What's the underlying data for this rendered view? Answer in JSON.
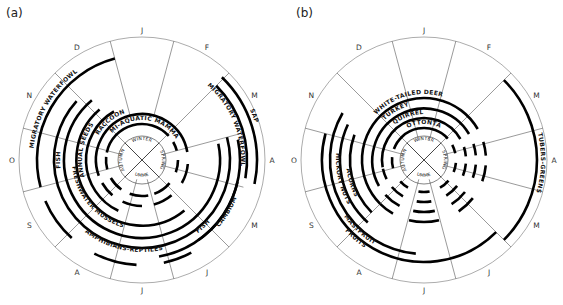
{
  "figure": {
    "panels": [
      {
        "id": "a",
        "label": "(a)",
        "center": [
          142,
          160
        ],
        "outer_radius": 123,
        "months": [
          "J",
          "F",
          "M",
          "A",
          "M",
          "J",
          "J",
          "A",
          "S",
          "O",
          "N",
          "D"
        ],
        "seasons": [
          "WINTER",
          "SPRING",
          "SUMMER",
          "AUTUMN"
        ],
        "season_radius": 20,
        "spokes": [
          {
            "angle": 15,
            "r0": 44,
            "r1": 123
          },
          {
            "angle": 45,
            "r0": 0,
            "r1": 123
          },
          {
            "angle": 75,
            "r0": 20,
            "r1": 100
          },
          {
            "angle": 105,
            "r0": 20,
            "r1": 105
          },
          {
            "angle": 135,
            "r0": 0,
            "r1": 123
          },
          {
            "angle": 165,
            "r0": 20,
            "r1": 123
          },
          {
            "angle": 195,
            "r0": 20,
            "r1": 123
          },
          {
            "angle": 225,
            "r0": 0,
            "r1": 123
          },
          {
            "angle": 255,
            "r0": 20,
            "r1": 123
          },
          {
            "angle": 285,
            "r0": 20,
            "r1": 123
          },
          {
            "angle": 315,
            "r0": 0,
            "r1": 123
          },
          {
            "angle": 345,
            "r0": 44,
            "r1": 123
          }
        ],
        "rings": [
          {
            "name": "SEMI-AQUATIC MAMMALS",
            "r": 36,
            "solid": [
              [
                282,
                48
              ]
            ],
            "dashes": [
              [
                60,
                75
              ],
              [
                90,
                110
              ],
              [
                130,
                160
              ],
              [
                170,
                200
              ],
              [
                215,
                240
              ],
              [
                255,
                275
              ]
            ],
            "label_angle": 0
          },
          {
            "name": "RACCOON",
            "r": 46,
            "solid": [
              [
                250,
                80
              ]
            ],
            "dashes": [
              [
                95,
                120
              ],
              [
                140,
                165
              ],
              [
                180,
                205
              ],
              [
                220,
                240
              ]
            ],
            "label_angle": 315
          },
          {
            "name": "ANNUAL SEEDS",
            "r": 56,
            "solid": [
              [
                205,
                330
              ]
            ],
            "dashes": [],
            "label_angle": 282
          },
          {
            "name": "FRESHWATER MUSSELS",
            "r": 66,
            "solid": [
              [
                140,
                320
              ]
            ],
            "dashes": [],
            "label_angle": 240
          },
          {
            "name": "FISH",
            "r": 78,
            "solid": [
              [
                78,
                320
              ]
            ],
            "dashes": [],
            "label_angle": 270
          },
          {
            "name": "AMPHIBIANS-REPTILES",
            "r": 88,
            "solid": [
              [
                75,
                312
              ]
            ],
            "dashes": [],
            "label_angle": 185
          },
          {
            "name": "FISH-SPRING",
            "r": 98,
            "solid": [
              [
                78,
                170
              ]
            ],
            "dashes": [],
            "label_angle": null
          },
          {
            "name": "CAMBIUM",
            "r": 98,
            "solid": [
              [
                103,
                145
              ]
            ],
            "dashes": [],
            "label_angle": 112
          },
          {
            "name": "MIGRATORY WATERFOWL",
            "r": 105,
            "solid": [
              [
                255,
                345
              ],
              [
                45,
                100
              ]
            ],
            "dashes": [
              [
                152,
                168
              ],
              [
                183,
                207
              ],
              [
                222,
                247
              ]
            ],
            "label_angle": 300
          },
          {
            "name": "SAP",
            "r": 115,
            "solid": [
              [
                44,
                102
              ]
            ],
            "dashes": [],
            "label_angle": 70
          }
        ],
        "ring_text": [
          {
            "text": "SEMI-AQUATIC MAMMALS",
            "r": 40,
            "start": -45,
            "end": 55
          },
          {
            "text": "RACCOON",
            "r": 50,
            "start": -60,
            "end": -20
          },
          {
            "text": "ANNUAL SEEDS",
            "r": 60,
            "start": -105,
            "end": -55
          },
          {
            "text": "FRESHWATER MUSSELS",
            "r": 70,
            "start": -165,
            "end": -95
          },
          {
            "text": "FISH",
            "r": 82,
            "start": -98,
            "end": -82
          },
          {
            "text": "AMPHIBIANS-REPTILES",
            "r": 92,
            "start": 155,
            "end": 230
          },
          {
            "text": "FISH",
            "r": 92,
            "start": 130,
            "end": 145
          },
          {
            "text": "CAMBIUM",
            "r": 102,
            "start": 108,
            "end": 135
          },
          {
            "text": "MIGRATORY WATERFOWL",
            "r": 109,
            "start": -95,
            "end": -25
          },
          {
            "text": "MIGRATORY WATERFOWL",
            "r": 99,
            "start": 35,
            "end": 100
          },
          {
            "text": "SAP",
            "r": 119,
            "start": 62,
            "end": 75
          }
        ]
      },
      {
        "id": "b",
        "label": "(b)",
        "center": [
          424,
          160
        ],
        "outer_radius": 123,
        "months": [
          "J",
          "F",
          "M",
          "A",
          "M",
          "J",
          "J",
          "A",
          "S",
          "O",
          "N",
          "D"
        ],
        "seasons": [
          "WINTER",
          "SPRING",
          "SUMMER",
          "AUTUMN"
        ],
        "season_radius": 20,
        "spokes": [
          {
            "angle": 15,
            "r0": 20,
            "r1": 123
          },
          {
            "angle": 45,
            "r0": 0,
            "r1": 123
          },
          {
            "angle": 75,
            "r0": 20,
            "r1": 123
          },
          {
            "angle": 105,
            "r0": 20,
            "r1": 123
          },
          {
            "angle": 135,
            "r0": 0,
            "r1": 123
          },
          {
            "angle": 165,
            "r0": 20,
            "r1": 123
          },
          {
            "angle": 195,
            "r0": 20,
            "r1": 123
          },
          {
            "angle": 225,
            "r0": 0,
            "r1": 123
          },
          {
            "angle": 255,
            "r0": 20,
            "r1": 123
          },
          {
            "angle": 285,
            "r0": 20,
            "r1": 123
          },
          {
            "angle": 315,
            "r0": 0,
            "r1": 123
          },
          {
            "angle": 345,
            "r0": 20,
            "r1": 123
          }
        ],
        "rings": [
          {
            "name": "COTTONTAIL",
            "r": 32,
            "solid": [
              [
                290,
                48
              ]
            ],
            "dashes": [
              [
                62,
                78
              ],
              [
                95,
                112
              ],
              [
                130,
                150
              ],
              [
                170,
                190
              ],
              [
                210,
                228
              ],
              [
                255,
                275
              ]
            ],
            "label_angle": 0
          },
          {
            "name": "SQUIRRELS",
            "r": 42,
            "solid": [
              [
                260,
                60
              ]
            ],
            "dashes": [
              [
                72,
                85
              ],
              [
                95,
                112
              ],
              [
                128,
                148
              ],
              [
                170,
                190
              ],
              [
                210,
                230
              ],
              [
                243,
                258
              ]
            ],
            "label_angle": 330
          },
          {
            "name": "TURKEY",
            "r": 52,
            "solid": [
              [
                240,
                60
              ]
            ],
            "dashes": [
              [
                72,
                85
              ],
              [
                95,
                110
              ],
              [
                128,
                148
              ],
              [
                168,
                192
              ],
              [
                208,
                228
              ]
            ],
            "label_angle": 330
          },
          {
            "name": "WHITE-TAILED DEER",
            "r": 62,
            "solid": [
              [
                225,
                60
              ]
            ],
            "dashes": [
              [
                73,
                86
              ],
              [
                95,
                110
              ],
              [
                128,
                146
              ],
              [
                166,
                194
              ],
              [
                210,
                225
              ]
            ],
            "label_angle": 325
          },
          {
            "name": "ACORNS",
            "r": 74,
            "solid": [
              [
                225,
                290
              ]
            ],
            "dashes": [],
            "label_angle": 255
          },
          {
            "name": "HICKORY NUTS",
            "r": 84,
            "solid": [
              [
                222,
                295
              ]
            ],
            "dashes": [],
            "label_angle": 255
          },
          {
            "name": "MAST-FRUITS",
            "r": 94,
            "solid": [
              [
                185,
                300
              ]
            ],
            "dashes": [],
            "label_angle": 230
          },
          {
            "name": "FRUITS",
            "r": 102,
            "solid": [
              [
                135,
                285
              ]
            ],
            "dashes": [],
            "label_angle": 225
          },
          {
            "name": "TUBERS-GREENS",
            "r": 113,
            "solid": [
              [
                45,
                135
              ]
            ],
            "dashes": [],
            "label_angle": 90
          }
        ],
        "ring_text": [
          {
            "text": "COTTONTAIL",
            "r": 36,
            "start": -25,
            "end": 28
          },
          {
            "text": "SQUIRRELS",
            "r": 46,
            "start": -40,
            "end": 0
          },
          {
            "text": "TURKEY",
            "r": 56,
            "start": -45,
            "end": -15
          },
          {
            "text": "WHITE-TAILED DEER",
            "r": 66,
            "start": -55,
            "end": 25
          },
          {
            "text": "ACORNS",
            "r": 78,
            "start": -120,
            "end": -95
          },
          {
            "text": "HICKORY NUTS",
            "r": 88,
            "start": -128,
            "end": -78
          },
          {
            "text": "MASTFRUIT",
            "r": 98,
            "start": -150,
            "end": -125
          },
          {
            "text": "FRUITS",
            "r": 106,
            "start": -150,
            "end": -128
          },
          {
            "text": "TUBERS-GREENS",
            "r": 117,
            "start": 75,
            "end": 108
          }
        ]
      }
    ]
  }
}
